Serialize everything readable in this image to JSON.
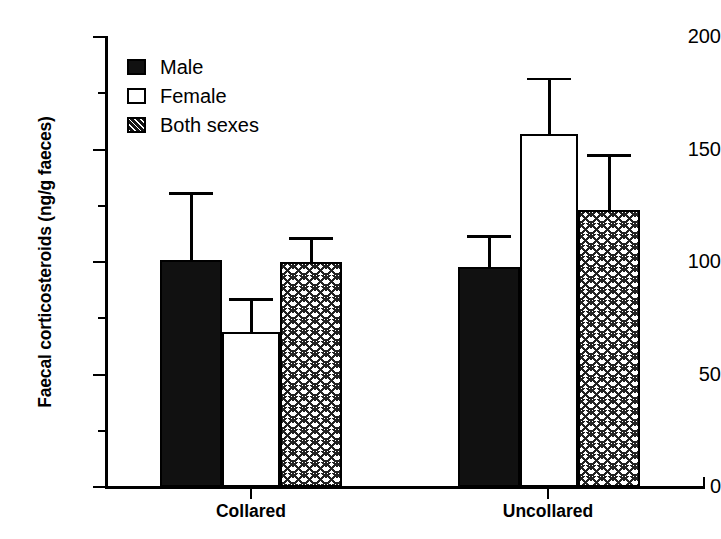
{
  "chart_data": {
    "type": "bar",
    "title": "",
    "xlabel": "",
    "ylabel": "Faecal corticosteroids (ng/g faeces)",
    "ylim": [
      0,
      200
    ],
    "ytick_major": [
      0,
      50,
      100,
      150,
      200
    ],
    "ytick_minor": [
      25,
      75,
      125,
      175
    ],
    "grid": false,
    "legend_position": "upper-left-inside",
    "categories": [
      "Collared",
      "Uncollared"
    ],
    "series": [
      {
        "name": "Male",
        "style": "solid-black",
        "values": [
          101,
          98
        ],
        "errors_upper": [
          30,
          14
        ]
      },
      {
        "name": "Female",
        "style": "open-white",
        "values": [
          69,
          157
        ],
        "errors_upper": [
          15,
          25
        ]
      },
      {
        "name": "Both sexes",
        "style": "hatched",
        "values": [
          100,
          123
        ],
        "errors_upper": [
          11,
          25
        ]
      }
    ]
  },
  "axis": {
    "y_tick_labels": [
      "200",
      "150",
      "100",
      "50",
      "0"
    ],
    "y_title": "Faecal corticosteroids (ng/g faeces)",
    "x_tick_labels": [
      "Collared",
      "Uncollared"
    ]
  },
  "legend": {
    "items": [
      {
        "label": "Male",
        "swatch": "solid-square-icon"
      },
      {
        "label": "Female",
        "swatch": "open-square-icon"
      },
      {
        "label": "Both sexes",
        "swatch": "hatched-square-icon"
      }
    ]
  }
}
